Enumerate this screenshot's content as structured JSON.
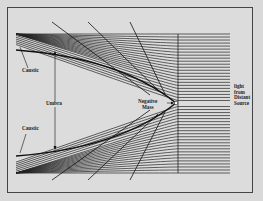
{
  "diagram": {
    "type": "negative-mass-lensing",
    "labels": {
      "caustic_top": "Caustic",
      "caustic_bottom": "Caustic",
      "umbra": "Umbra",
      "negative_mass_1": "Negative",
      "negative_mass_2": "Mass",
      "source_1": "light",
      "source_2": "from",
      "source_3": "Distant",
      "source_4": "Source"
    },
    "colors": {
      "ink": "#222222",
      "paper": "#dcdcdc"
    }
  }
}
